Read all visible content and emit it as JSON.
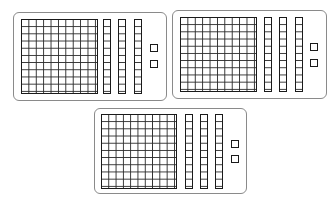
{
  "diagram": {
    "colors": {
      "line": "#1a1a1a",
      "card_border": "#8a8a8a",
      "background": "#ffffff"
    },
    "cards": [
      {
        "id": "card-1",
        "box": {
          "x": 13,
          "y": 12,
          "w": 154,
          "h": 89
        },
        "flat": {
          "x": 21,
          "y": 19,
          "w": 77,
          "h": 75,
          "rows": 10,
          "cols": 10
        },
        "rods": [
          {
            "x": 103,
            "y": 19,
            "w": 8,
            "h": 75,
            "cells": 10
          },
          {
            "x": 118,
            "y": 19,
            "w": 8,
            "h": 75,
            "cells": 10
          },
          {
            "x": 134,
            "y": 19,
            "w": 8,
            "h": 75,
            "cells": 10
          }
        ],
        "units": [
          {
            "x": 150,
            "y": 44,
            "s": 8
          },
          {
            "x": 150,
            "y": 60,
            "s": 8
          }
        ]
      },
      {
        "id": "card-2",
        "box": {
          "x": 172,
          "y": 10,
          "w": 155,
          "h": 89
        },
        "flat": {
          "x": 180,
          "y": 17,
          "w": 77,
          "h": 75,
          "rows": 10,
          "cols": 10
        },
        "rods": [
          {
            "x": 264,
            "y": 17,
            "w": 8,
            "h": 75,
            "cells": 10
          },
          {
            "x": 279,
            "y": 17,
            "w": 8,
            "h": 75,
            "cells": 10
          },
          {
            "x": 295,
            "y": 17,
            "w": 8,
            "h": 75,
            "cells": 10
          }
        ],
        "units": [
          {
            "x": 310,
            "y": 43,
            "s": 8
          },
          {
            "x": 310,
            "y": 59,
            "s": 8
          }
        ]
      },
      {
        "id": "card-3",
        "box": {
          "x": 94,
          "y": 108,
          "w": 153,
          "h": 86
        },
        "flat": {
          "x": 101,
          "y": 114,
          "w": 76,
          "h": 75,
          "rows": 10,
          "cols": 10
        },
        "rods": [
          {
            "x": 185,
            "y": 114,
            "w": 8,
            "h": 75,
            "cells": 10
          },
          {
            "x": 200,
            "y": 114,
            "w": 8,
            "h": 75,
            "cells": 10
          },
          {
            "x": 215,
            "y": 114,
            "w": 8,
            "h": 75,
            "cells": 10
          }
        ],
        "units": [
          {
            "x": 231,
            "y": 140,
            "s": 8
          },
          {
            "x": 231,
            "y": 155,
            "s": 8
          }
        ]
      }
    ]
  }
}
